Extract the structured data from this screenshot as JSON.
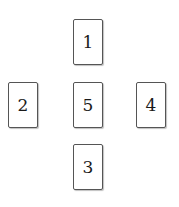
{
  "diagram": {
    "layout": "cross",
    "cards": [
      {
        "label": "1",
        "position": "top"
      },
      {
        "label": "2",
        "position": "left"
      },
      {
        "label": "3",
        "position": "bottom"
      },
      {
        "label": "4",
        "position": "right"
      },
      {
        "label": "5",
        "position": "center"
      }
    ]
  }
}
